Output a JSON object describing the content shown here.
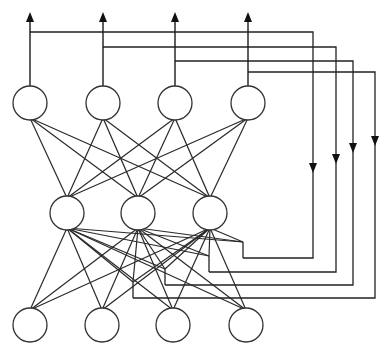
{
  "diagram": {
    "title": "",
    "colors": {
      "line": "#222222",
      "node_fill": "#ffffff",
      "node_stroke": "#333333",
      "background": "#ffffff"
    },
    "node_radius": 17,
    "layers": {
      "output": [
        {
          "id": "o1",
          "x": 30,
          "y": 103
        },
        {
          "id": "o2",
          "x": 103,
          "y": 103
        },
        {
          "id": "o3",
          "x": 175,
          "y": 103
        },
        {
          "id": "o4",
          "x": 248,
          "y": 103
        }
      ],
      "hidden": [
        {
          "id": "h1",
          "x": 67,
          "y": 213
        },
        {
          "id": "h2",
          "x": 138,
          "y": 213
        },
        {
          "id": "h3",
          "x": 210,
          "y": 213
        }
      ],
      "input": [
        {
          "id": "i1",
          "x": 30,
          "y": 325
        },
        {
          "id": "i2",
          "x": 102,
          "y": 325
        },
        {
          "id": "i3",
          "x": 173,
          "y": 325
        },
        {
          "id": "i4",
          "x": 246,
          "y": 325
        }
      ]
    },
    "output_arrow_top_y": 12,
    "feedback_loops": [
      {
        "from": "o1",
        "tap_y": 32,
        "right_x": 313,
        "bottom_y": 258,
        "end_x": 243,
        "arrow_y": 172
      },
      {
        "from": "o2",
        "tap_y": 47,
        "right_x": 336,
        "bottom_y": 272,
        "end_x": 209,
        "arrow_y": 163
      },
      {
        "from": "o3",
        "tap_y": 61,
        "right_x": 353,
        "bottom_y": 285,
        "end_x": 165,
        "arrow_y": 152
      },
      {
        "from": "o4",
        "tap_y": 72,
        "right_x": 375,
        "bottom_y": 298,
        "end_x": 133,
        "arrow_y": 145
      }
    ]
  }
}
